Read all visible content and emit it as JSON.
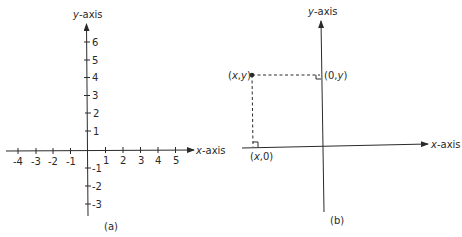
{
  "colors": {
    "ink": "#2a2a2a",
    "background": "#ffffff"
  },
  "panel_a": {
    "caption": "(a)",
    "x_axis_label_var": "x",
    "x_axis_label_rest": "-axis",
    "y_axis_label_var": "y",
    "y_axis_label_rest": "-axis",
    "x_ticks": [
      {
        "value": -4,
        "label": "-4"
      },
      {
        "value": -3,
        "label": "-3"
      },
      {
        "value": -2,
        "label": "-2"
      },
      {
        "value": -1,
        "label": "-1"
      },
      {
        "value": 1,
        "label": "1"
      },
      {
        "value": 2,
        "label": "2"
      },
      {
        "value": 3,
        "label": "3"
      },
      {
        "value": 4,
        "label": "4"
      },
      {
        "value": 5,
        "label": "5"
      }
    ],
    "y_ticks": [
      {
        "value": 6,
        "label": "6"
      },
      {
        "value": 5,
        "label": "5"
      },
      {
        "value": 4,
        "label": "4"
      },
      {
        "value": 3,
        "label": "3"
      },
      {
        "value": 2,
        "label": "2"
      },
      {
        "value": 1,
        "label": "1"
      },
      {
        "value": -1,
        "label": "-1"
      },
      {
        "value": -2,
        "label": "-2"
      },
      {
        "value": -3,
        "label": "-3"
      }
    ]
  },
  "panel_b": {
    "caption": "(b)",
    "x_axis_label_var": "x",
    "x_axis_label_rest": "-axis",
    "y_axis_label_var": "y",
    "y_axis_label_rest": "-axis",
    "point_label": "(x,y)",
    "point_label_parts": {
      "open": "(",
      "x": "x",
      "comma": ",",
      "y": "y",
      "close": ")"
    },
    "y_projection_label_parts": {
      "open": "(0,",
      "y": "y",
      "close": ")"
    },
    "x_projection_label_parts": {
      "open": "(",
      "x": "x",
      "close": ",0)"
    }
  }
}
